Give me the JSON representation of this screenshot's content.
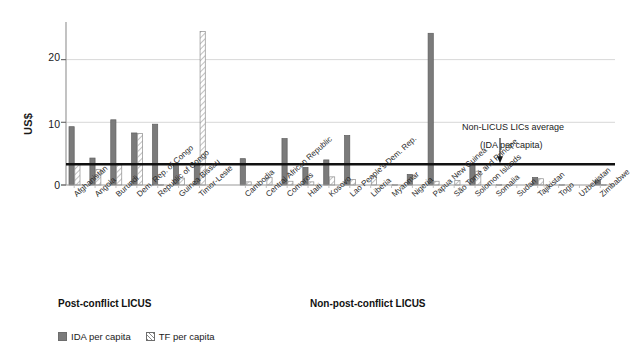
{
  "chart_data": {
    "type": "bar",
    "title": "",
    "subtitle": "",
    "xlabel": "",
    "ylabel": "US$",
    "ylim": [
      0,
      26
    ],
    "yticks": [
      0,
      10,
      20
    ],
    "ytick_labels": [
      "0",
      "10",
      "20"
    ],
    "grid": true,
    "legend_position": "bottom-left",
    "legend": [
      "IDA per capita",
      "TF per capita"
    ],
    "series": [
      {
        "name": "IDA per capita",
        "style": "solid-gray",
        "color": "#7b7b7b",
        "values": [
          9.3,
          4.3,
          10.4,
          8.3,
          9.7,
          3.1,
          3.5,
          4.2,
          0.0,
          7.4,
          2.8,
          4.0,
          7.9,
          0.0,
          0.0,
          1.7,
          24.2,
          0.0,
          3.3,
          0.0,
          0.0,
          1.2,
          0.0,
          0.0,
          0.8
        ]
      },
      {
        "name": "TF per capita",
        "style": "hatched",
        "color": "#ffffff",
        "values": [
          3.3,
          2.5,
          3.2,
          8.2,
          0.1,
          1.1,
          24.5,
          0.5,
          1.2,
          0.6,
          0.5,
          1.3,
          0.9,
          1.4,
          0.1,
          0.0,
          0.6,
          0.7,
          2.2,
          0.1,
          0.0,
          1.0,
          0.1,
          0.0,
          0.1
        ]
      }
    ],
    "categories": [
      "Afghanistan",
      "Angola",
      "Burundi",
      "Dem. Rep. of Congo",
      "Republic of Congo",
      "Guinea Bissau",
      "Timor-Leste",
      "Cambodia",
      "Central African Republic",
      "Comoros",
      "Haiti",
      "Kosovo",
      "Lao People's Dem. Rep.",
      "Liberia",
      "Myanmar",
      "Nigeria",
      "Papua New Guinea",
      "São Tomé and Principe",
      "Solomon Islands",
      "Somalia",
      "Sudan",
      "Tajikistan",
      "Togo",
      "Uzbekistan",
      "Zimbabwe"
    ],
    "reference_line": {
      "value": 3.3,
      "label_line1": "Non-LICUS LICs average",
      "label_line2": "(IDA per capita)",
      "color": "#111111"
    },
    "groups": [
      {
        "label": "Post-conflict LICUS",
        "start": 0,
        "end": 6
      },
      {
        "label": "Non-post-conflict LICUS",
        "start": 7,
        "end": 24
      }
    ]
  }
}
